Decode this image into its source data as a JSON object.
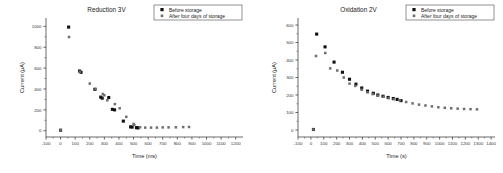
{
  "figure": {
    "panels": [
      "reduction",
      "oxidation"
    ]
  },
  "legend": {
    "series": [
      {
        "key": "before",
        "label": "Before storage",
        "marker": "filled-square",
        "color": "#111111"
      },
      {
        "key": "after",
        "label": "After four days of storage",
        "marker": "grey-square",
        "color": "#6e6e6e"
      }
    ]
  },
  "chart_data": [
    {
      "id": "reduction",
      "type": "scatter",
      "title": "Reduction 3V",
      "xlabel": "Time (ms)",
      "ylabel": "Current (µA)",
      "xlim": [
        -100,
        1250
      ],
      "ylim": [
        -60,
        1080
      ],
      "xticks": [
        -100,
        0,
        100,
        200,
        300,
        400,
        500,
        600,
        700,
        800,
        900,
        1000,
        1100,
        1200
      ],
      "yticks": [
        0,
        200,
        400,
        600,
        800,
        1000
      ],
      "grid": false,
      "legend_position": "top-right",
      "series": [
        {
          "name": "Before storage",
          "marker": "filled-square",
          "color": "#111111",
          "points": [
            [
              0,
              5
            ],
            [
              55,
              993
            ],
            [
              130,
              572
            ],
            [
              140,
              560
            ],
            [
              235,
              397
            ],
            [
              275,
              322
            ],
            [
              285,
              312
            ],
            [
              330,
              318
            ],
            [
              355,
              205
            ],
            [
              370,
              200
            ],
            [
              430,
              92
            ],
            [
              480,
              37
            ],
            [
              490,
              35
            ],
            [
              520,
              30
            ],
            [
              530,
              27
            ]
          ]
        },
        {
          "name": "After four days of storage",
          "marker": "grey-square",
          "color": "#6e6e6e",
          "points": [
            [
              0,
              5
            ],
            [
              58,
              898
            ],
            [
              132,
              565
            ],
            [
              200,
              452
            ],
            [
              240,
              400
            ],
            [
              290,
              352
            ],
            [
              300,
              340
            ],
            [
              320,
              292
            ],
            [
              372,
              255
            ],
            [
              405,
              215
            ],
            [
              450,
              133
            ],
            [
              500,
              65
            ],
            [
              505,
              55
            ],
            [
              545,
              33
            ],
            [
              580,
              30
            ],
            [
              620,
              30
            ],
            [
              660,
              30
            ],
            [
              700,
              32
            ],
            [
              740,
              32
            ],
            [
              790,
              33
            ],
            [
              840,
              35
            ],
            [
              880,
              36
            ]
          ]
        }
      ]
    },
    {
      "id": "oxidation",
      "type": "scatter",
      "title": "Oxidation 2V",
      "xlabel": "Time (s)",
      "ylabel": "Current (µA)",
      "xlim": [
        -100,
        1430
      ],
      "ylim": [
        -40,
        640
      ],
      "xticks": [
        -100,
        0,
        100,
        200,
        300,
        400,
        500,
        600,
        700,
        800,
        900,
        1000,
        1100,
        1200,
        1300,
        1400
      ],
      "yticks": [
        0,
        100,
        200,
        300,
        400,
        500,
        600
      ],
      "grid": false,
      "legend_position": "top-right",
      "series": [
        {
          "name": "Before storage",
          "marker": "filled-square",
          "color": "#111111",
          "points": [
            [
              20,
              3
            ],
            [
              45,
              548
            ],
            [
              110,
              475
            ],
            [
              180,
              388
            ],
            [
              245,
              330
            ],
            [
              300,
              290
            ],
            [
              350,
              262
            ],
            [
              395,
              240
            ],
            [
              440,
              222
            ],
            [
              485,
              210
            ],
            [
              520,
              200
            ],
            [
              560,
              193
            ],
            [
              600,
              186
            ],
            [
              640,
              180
            ],
            [
              670,
              175
            ],
            [
              700,
              168
            ]
          ]
        },
        {
          "name": "After four days of storage",
          "marker": "grey-square",
          "color": "#6e6e6e",
          "points": [
            [
              20,
              3
            ],
            [
              40,
              423
            ],
            [
              112,
              440
            ],
            [
              150,
              352
            ],
            [
              205,
              340
            ],
            [
              255,
              300
            ],
            [
              300,
              265
            ],
            [
              345,
              252
            ],
            [
              395,
              230
            ],
            [
              440,
              215
            ],
            [
              480,
              205
            ],
            [
              520,
              196
            ],
            [
              565,
              190
            ],
            [
              605,
              182
            ],
            [
              645,
              176
            ],
            [
              690,
              170
            ],
            [
              740,
              160
            ],
            [
              790,
              152
            ],
            [
              840,
              145
            ],
            [
              890,
              140
            ],
            [
              940,
              135
            ],
            [
              990,
              130
            ],
            [
              1040,
              127
            ],
            [
              1090,
              124
            ],
            [
              1140,
              122
            ],
            [
              1190,
              120
            ],
            [
              1240,
              119
            ],
            [
              1290,
              118
            ]
          ]
        }
      ]
    }
  ]
}
